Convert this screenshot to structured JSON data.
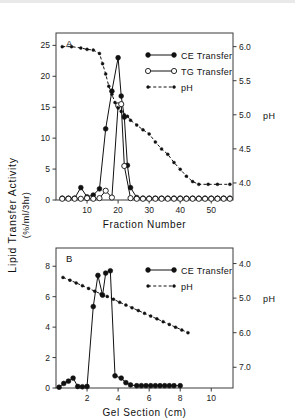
{
  "figure": {
    "y_axis_label_line1": "Lipid Transfer Activity",
    "y_axis_label_line2": "(%/ml/3hr)"
  },
  "chart_data": [
    {
      "type": "line",
      "panel": "A",
      "title": "A",
      "xlabel": "Fraction Number",
      "ylabel": "Lipid Transfer Activity (%/ml/3hr)",
      "y2label": "pH",
      "xlim": [
        0,
        57
      ],
      "ylim": [
        0,
        27
      ],
      "y2lim": [
        3.75,
        6.2
      ],
      "xticks": [
        10,
        20,
        30,
        40,
        50
      ],
      "yticks": [
        0,
        5,
        10,
        15,
        20,
        25
      ],
      "y2ticks": [
        4.0,
        4.5,
        5.0,
        5.5,
        6.0
      ],
      "xticklabels": [
        "10",
        "20",
        "30",
        "40",
        "50"
      ],
      "yticklabels": [
        "0",
        "5",
        "10",
        "15",
        "20",
        "25"
      ],
      "y2ticklabels": [
        "4.0",
        "4.5",
        "5.0",
        "5.5",
        "6.0"
      ],
      "grid": false,
      "legend_position": "upper-right",
      "series": [
        {
          "name": "CE Transfer",
          "axis": "left",
          "marker": "filled-circle",
          "linestyle": "solid",
          "x": [
            2,
            4,
            6,
            8,
            10,
            12,
            14,
            16,
            18,
            20,
            21,
            22,
            23,
            24,
            26,
            28,
            30,
            32,
            34,
            36,
            38,
            40,
            42,
            44,
            46,
            48,
            50,
            52,
            54,
            56
          ],
          "y": [
            0.3,
            0.3,
            0.3,
            2.0,
            0.5,
            0.8,
            1.8,
            11.5,
            17.6,
            23.0,
            16.8,
            13.4,
            5.6,
            2.0,
            0.4,
            0.3,
            0.3,
            0.3,
            0.3,
            0.3,
            0.3,
            0.3,
            0.3,
            0.3,
            0.3,
            0.3,
            0.3,
            0.3,
            0.3,
            0.3
          ]
        },
        {
          "name": "TG Transfer",
          "axis": "left",
          "marker": "open-circle",
          "linestyle": "solid",
          "x": [
            2,
            4,
            6,
            8,
            10,
            12,
            14,
            16,
            18,
            20,
            21,
            22,
            24,
            26,
            28,
            30,
            32,
            34,
            36,
            38,
            40,
            42,
            44,
            46,
            48,
            50,
            52,
            54,
            56
          ],
          "y": [
            0.2,
            0.2,
            0.2,
            0.2,
            0.3,
            0.2,
            0.3,
            1.5,
            0.4,
            15.3,
            15.5,
            5.5,
            0.3,
            0.2,
            0.2,
            0.2,
            0.2,
            0.2,
            0.2,
            0.2,
            0.2,
            0.2,
            0.2,
            0.2,
            0.2,
            0.2,
            0.2,
            0.2,
            0.2
          ]
        },
        {
          "name": "pH",
          "axis": "right",
          "marker": "filled-circle-small",
          "linestyle": "dashed",
          "x": [
            2,
            5,
            8,
            10,
            12,
            14,
            15,
            16,
            17,
            18,
            19,
            20,
            21,
            22,
            23,
            24,
            26,
            28,
            30,
            32,
            34,
            36,
            38,
            40,
            42,
            44,
            46,
            49,
            52,
            56
          ],
          "y": [
            6.0,
            6.0,
            5.98,
            5.96,
            5.95,
            5.9,
            5.75,
            5.6,
            5.42,
            5.3,
            5.18,
            5.1,
            5.05,
            5.0,
            4.98,
            4.92,
            4.85,
            4.78,
            4.72,
            4.6,
            4.5,
            4.42,
            4.3,
            4.2,
            4.1,
            4.02,
            3.98,
            3.98,
            3.98,
            3.98
          ]
        }
      ]
    },
    {
      "type": "line",
      "panel": "B",
      "title": "B",
      "xlabel": "Gel Section (cm)",
      "ylabel": "Lipid Transfer Activity (%/ml/3hr)",
      "y2label": "pH",
      "xlim": [
        0,
        11.4
      ],
      "ylim": [
        0,
        9.2
      ],
      "y2lim": [
        3.55,
        7.6
      ],
      "y2_inverted": true,
      "xticks": [
        2,
        4,
        6,
        8,
        10
      ],
      "yticks": [
        0,
        2,
        4,
        6,
        8
      ],
      "y2ticks": [
        4.0,
        5.0,
        6.0,
        7.0
      ],
      "xticklabels": [
        "2",
        "4",
        "6",
        "8",
        "10"
      ],
      "yticklabels": [
        "0",
        "2",
        "4",
        "6",
        "8"
      ],
      "y2ticklabels": [
        "4.0",
        "5.0",
        "6.0",
        "7.0"
      ],
      "grid": false,
      "legend_position": "upper-right",
      "series": [
        {
          "name": "CE Transfer",
          "axis": "left",
          "marker": "filled-circle",
          "linestyle": "solid",
          "x": [
            0.2,
            0.5,
            0.8,
            1.1,
            1.4,
            1.7,
            2.0,
            2.4,
            2.7,
            3.0,
            3.2,
            3.5,
            3.8,
            4.2,
            4.5,
            4.8,
            5.2,
            5.5,
            5.8,
            6.1,
            6.4,
            6.7,
            7.0,
            7.3,
            7.6,
            8.0
          ],
          "y": [
            0.05,
            0.3,
            0.45,
            0.65,
            0.1,
            0.08,
            0.1,
            5.35,
            7.4,
            6.1,
            7.55,
            7.7,
            0.8,
            0.65,
            0.35,
            0.2,
            0.15,
            0.15,
            0.15,
            0.15,
            0.15,
            0.15,
            0.15,
            0.15,
            0.15,
            0.15
          ]
        },
        {
          "name": "pH",
          "axis": "right",
          "marker": "filled-circle-small",
          "linestyle": "dotted",
          "x": [
            0.45,
            0.9,
            1.3,
            1.7,
            2.1,
            2.5,
            2.9,
            3.3,
            3.7,
            4.1,
            4.5,
            4.9,
            5.3,
            5.7,
            6.1,
            6.5,
            6.9,
            7.3,
            7.7,
            8.1,
            8.5
          ],
          "y": [
            4.4,
            4.48,
            4.56,
            4.64,
            4.72,
            4.8,
            4.88,
            4.95,
            5.03,
            5.12,
            5.2,
            5.28,
            5.36,
            5.44,
            5.52,
            5.6,
            5.68,
            5.76,
            5.84,
            5.92,
            6.0
          ]
        }
      ]
    }
  ]
}
